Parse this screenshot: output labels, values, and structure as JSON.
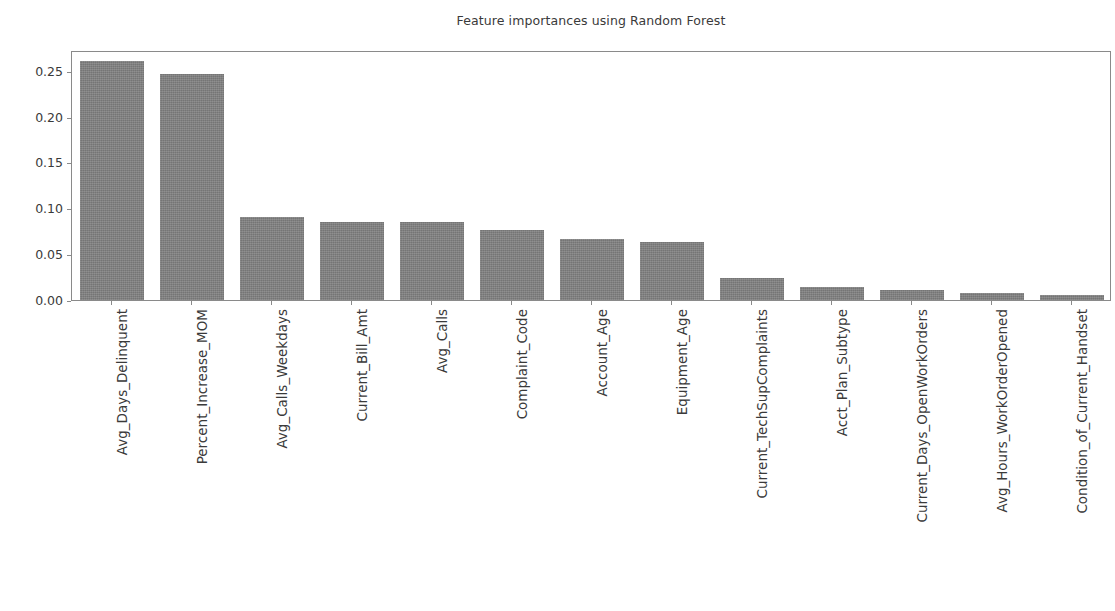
{
  "chart_data": {
    "type": "bar",
    "title": "Feature importances using Random Forest",
    "xlabel": "",
    "ylabel": "",
    "ylim": [
      0.0,
      0.2725
    ],
    "grid": false,
    "legend": null,
    "orientation": "vertical",
    "bar_color": "#808080",
    "ytick_labels": [
      "0.00",
      "0.05",
      "0.10",
      "0.15",
      "0.20",
      "0.25"
    ],
    "ytick_values": [
      0.0,
      0.05,
      0.1,
      0.15,
      0.2,
      0.25
    ],
    "categories": [
      "Avg_Days_Delinquent",
      "Percent_Increase_MOM",
      "Avg_Calls_Weekdays",
      "Current_Bill_Amt",
      "Avg_Calls",
      "Complaint_Code",
      "Account_Age",
      "Equipment_Age",
      "Current_TechSupComplaints",
      "Acct_Plan_Subtype",
      "Current_Days_OpenWorkOrders",
      "Avg_Hours_WorkOrderOpened",
      "Condition_of_Current_Handset"
    ],
    "values": [
      0.26,
      0.246,
      0.091,
      0.0855,
      0.0855,
      0.0765,
      0.0665,
      0.063,
      0.0245,
      0.0145,
      0.0105,
      0.0075,
      0.005
    ]
  },
  "figure": {
    "background_color": "#ffffff",
    "axes_edge_color": "#8a8a8a",
    "text_color": "#3a3a3a"
  }
}
